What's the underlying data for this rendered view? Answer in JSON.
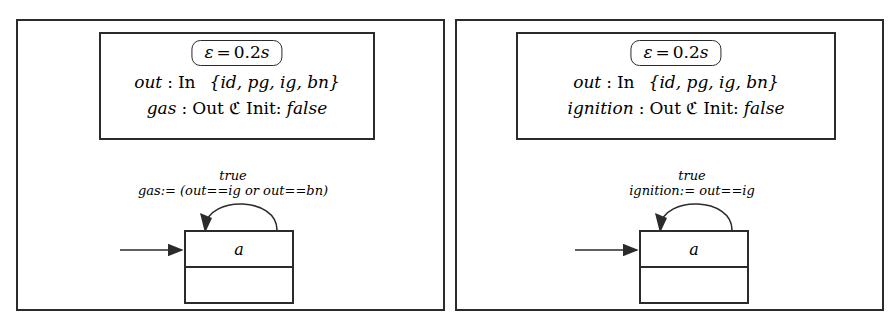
{
  "figure": {
    "type": "statechart-pair",
    "panel_count": 2
  },
  "panels": [
    {
      "id": "gas-component",
      "declaration": {
        "epsilon": {
          "symbol": "ε",
          "equals": "=",
          "value": "0.2",
          "unit": "s",
          "full": "ε = 0.2s"
        },
        "ports": [
          {
            "name": "out",
            "colon": ":",
            "direction": "In",
            "type": "{id, pg, ig, bn}",
            "init_label": "",
            "init_value": ""
          },
          {
            "name": "gas",
            "colon": ":",
            "direction": "Out",
            "type": "ℭ",
            "init_label": "Init:",
            "init_value": "false"
          }
        ]
      },
      "transition": {
        "guard": "true",
        "action": "gas:= (out==ig or out==bn)"
      },
      "state": {
        "label": "a",
        "lower_compartment": ""
      },
      "initial_arrow": true,
      "self_loop": true
    },
    {
      "id": "ignition-component",
      "declaration": {
        "epsilon": {
          "symbol": "ε",
          "equals": "=",
          "value": "0.2",
          "unit": "s",
          "full": "ε = 0.2s"
        },
        "ports": [
          {
            "name": "out",
            "colon": ":",
            "direction": "In",
            "type": "{id, pg, ig, bn}",
            "init_label": "",
            "init_value": ""
          },
          {
            "name": "ignition",
            "colon": ":",
            "direction": "Out",
            "type": "ℭ",
            "init_label": "Init:",
            "init_value": "false"
          }
        ]
      },
      "transition": {
        "guard": "true",
        "action": "ignition:= out==ig"
      },
      "state": {
        "label": "a",
        "lower_compartment": ""
      },
      "initial_arrow": true,
      "self_loop": true
    }
  ],
  "colors": {
    "ink": "#2b2b2b",
    "paper": "#ffffff"
  }
}
